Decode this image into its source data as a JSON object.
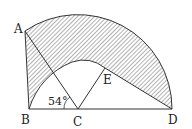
{
  "diagram": {
    "points": {
      "A": "A",
      "B": "B",
      "C": "C",
      "D": "D",
      "E": "E"
    },
    "angle_label": "54°",
    "colors": {
      "stroke": "#333333",
      "hatch": "#555555",
      "background": "#ffffff"
    }
  }
}
